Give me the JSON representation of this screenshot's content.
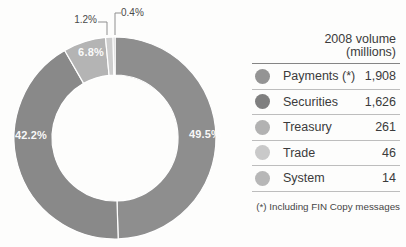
{
  "chart_data": {
    "type": "pie",
    "subtype": "donut",
    "title": "2008 volume (millions)",
    "legend_position": "right",
    "segments": [
      {
        "id": "payments",
        "name": "Payments (*)",
        "value": 1908,
        "pct": 49.5,
        "pct_label": "49.5%",
        "color": "#8e8e8e"
      },
      {
        "id": "securities",
        "name": "Securities",
        "value": 1626,
        "pct": 42.2,
        "pct_label": "42.2%",
        "color": "#898989"
      },
      {
        "id": "treasury",
        "name": "Treasury",
        "value": 261,
        "pct": 6.8,
        "pct_label": "6.8%",
        "color": "#b4b4b4"
      },
      {
        "id": "trade",
        "name": "Trade",
        "value": 46,
        "pct": 1.2,
        "pct_label": "1.2%",
        "color": "#cdcdcd"
      },
      {
        "id": "system",
        "name": "System",
        "value": 14,
        "pct": 0.4,
        "pct_label": "0.4%",
        "color": "#b8b8b8"
      }
    ]
  },
  "legend": {
    "header_line1": "2008 volume",
    "header_line2": "(millions)",
    "rows": [
      {
        "label": "Payments (*)",
        "value": "1,908",
        "color": "#949494"
      },
      {
        "label": "Securities",
        "value": "1,626",
        "color": "#7f7f7f"
      },
      {
        "label": "Treasury",
        "value": "261",
        "color": "#b2b2b2"
      },
      {
        "label": "Trade",
        "value": "46",
        "color": "#c9c9c9"
      },
      {
        "label": "System",
        "value": "14",
        "color": "#b7b7b7"
      }
    ],
    "footnote": "(*) Including FIN Copy messages"
  }
}
